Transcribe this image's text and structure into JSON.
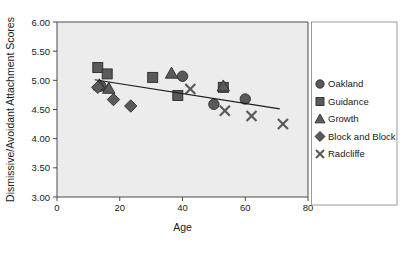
{
  "chart_data": {
    "type": "scatter",
    "title": "",
    "xlabel": "Age",
    "ylabel": "Dismissive/Avoidant Attachment Scores",
    "xlim": [
      0,
      80
    ],
    "ylim": [
      3.0,
      6.0
    ],
    "xticks": [
      "0",
      "20",
      "40",
      "60",
      "80"
    ],
    "xtick_values": [
      0,
      20,
      40,
      60,
      80
    ],
    "yticks": [
      "3.00",
      "3.50",
      "4.00",
      "4.50",
      "5.00",
      "5.50",
      "6.00"
    ],
    "ytick_values": [
      3.0,
      3.5,
      4.0,
      4.5,
      5.0,
      5.5,
      6.0
    ],
    "grid": false,
    "legend_position": "right",
    "marker_color": "#5a5a5a",
    "marker_edge_color": "#2b2b2b",
    "plot_background": "#ececed",
    "series": [
      {
        "name": "Oakland",
        "marker": "circle",
        "points": [
          {
            "x": 14.0,
            "y": 4.9
          },
          {
            "x": 40.0,
            "y": 5.07
          },
          {
            "x": 50.0,
            "y": 4.59
          },
          {
            "x": 60.0,
            "y": 4.68
          }
        ]
      },
      {
        "name": "Guidance",
        "marker": "square",
        "points": [
          {
            "x": 13.0,
            "y": 5.22
          },
          {
            "x": 16.0,
            "y": 5.11
          },
          {
            "x": 30.5,
            "y": 5.05
          },
          {
            "x": 38.5,
            "y": 4.74
          },
          {
            "x": 53.0,
            "y": 4.88
          }
        ]
      },
      {
        "name": "Growth",
        "marker": "triangle",
        "points": [
          {
            "x": 13.5,
            "y": 4.92
          },
          {
            "x": 16.5,
            "y": 4.86
          },
          {
            "x": 36.5,
            "y": 5.12
          },
          {
            "x": 53.0,
            "y": 4.9
          }
        ]
      },
      {
        "name": "Block and Block",
        "marker": "diamond",
        "points": [
          {
            "x": 13.0,
            "y": 4.88
          },
          {
            "x": 18.0,
            "y": 4.67
          },
          {
            "x": 23.5,
            "y": 4.56
          }
        ]
      },
      {
        "name": "Radcliffe",
        "marker": "x",
        "points": [
          {
            "x": 42.5,
            "y": 4.85
          },
          {
            "x": 53.5,
            "y": 4.48
          },
          {
            "x": 62.0,
            "y": 4.39
          },
          {
            "x": 72.0,
            "y": 4.25
          }
        ]
      }
    ],
    "trendline": {
      "x_start": 12.0,
      "y_start": 5.01,
      "x_end": 71.0,
      "y_end": 4.51
    },
    "annotations": []
  },
  "legend": {
    "items": [
      {
        "label": "Oakland",
        "marker": "circle"
      },
      {
        "label": "Guidance",
        "marker": "square"
      },
      {
        "label": "Growth",
        "marker": "triangle"
      },
      {
        "label": "Block and Block",
        "marker": "diamond"
      },
      {
        "label": "Radcliffe",
        "marker": "x"
      }
    ]
  },
  "page_bleed": {
    "line1": "ccess the Lifespan",
    "line2": "ow and society and maintain social"
  }
}
